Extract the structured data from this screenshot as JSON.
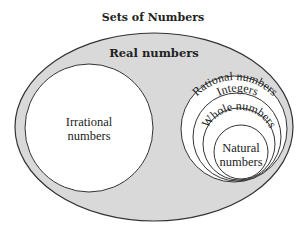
{
  "title": "Sets of Numbers",
  "sets": {
    "real": "Real numbers",
    "irrational_line1": "Irrational",
    "irrational_line2": "numbers",
    "rational": "Rational numbers",
    "integers": "Integers",
    "whole": "Whole numbers",
    "natural_line1": "Natural",
    "natural_line2": "numbers"
  },
  "colors": {
    "real_fill": "#d9d9d9",
    "inner_fill": "#ffffff",
    "stroke": "#333333"
  }
}
